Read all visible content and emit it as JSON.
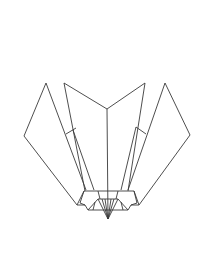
{
  "diagram": {
    "type": "origami-line-drawing",
    "stroke_color": "#3a3a3a",
    "background_color": "#ffffff"
  }
}
